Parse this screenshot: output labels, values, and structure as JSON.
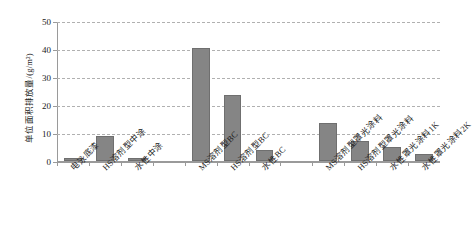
{
  "chart_data": {
    "type": "bar",
    "title": "",
    "xlabel": "",
    "ylabel": "单位面积排放量/(g/m²)",
    "ylim": [
      0,
      50
    ],
    "yticks": [
      0,
      10,
      20,
      30,
      40,
      50
    ],
    "grid": true,
    "legend": false,
    "bar_color": "#858585",
    "categories": [
      "电泳底漆",
      "HS溶剂型中涂",
      "水性中涂",
      "MS溶剂型BC",
      "HS溶剂型BC",
      "水性BC",
      "MS溶剂型罩光涂料",
      "HS溶剂型罩光涂料",
      "水性罩光涂料1K",
      "水性罩光涂料2K"
    ],
    "values": [
      1.2,
      9.0,
      1.2,
      40.5,
      23.5,
      4.0,
      13.5,
      7.0,
      5.0,
      2.5
    ],
    "group_gaps_after": [
      2,
      5
    ]
  }
}
